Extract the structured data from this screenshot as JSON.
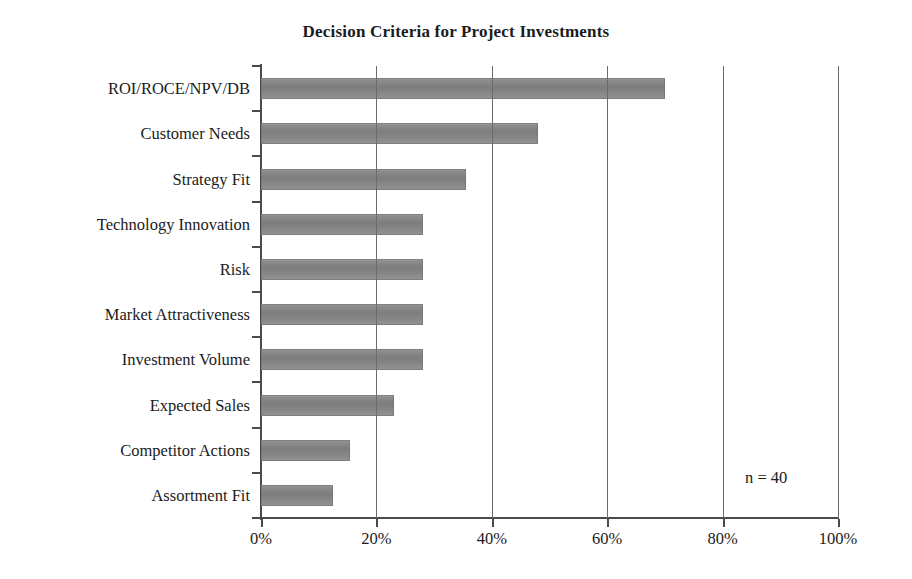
{
  "chart_data": {
    "type": "bar",
    "orientation": "horizontal",
    "title": "Decision Criteria for Project Investments",
    "xlabel": "",
    "ylabel": "",
    "categories": [
      "ROI/ROCE/NPV/DB",
      "Customer Needs",
      "Strategy Fit",
      "Technology Innovation",
      "Risk",
      "Market Attractiveness",
      "Investment Volume",
      "Expected Sales",
      "Competitor Actions",
      "Assortment Fit"
    ],
    "values": [
      70,
      48,
      35.5,
      28,
      28,
      28,
      28,
      23,
      15.5,
      12.5
    ],
    "xlim": [
      0,
      100
    ],
    "xticks": [
      0,
      20,
      40,
      60,
      80,
      100
    ],
    "xtick_labels": [
      "0%",
      "20%",
      "40%",
      "60%",
      "80%",
      "100%"
    ],
    "grid": "vertical",
    "legend": "none",
    "annotation": "n = 40",
    "bar_color": "#848484",
    "axis_color": "#4a4a4a",
    "text_color": "#1b1b1b",
    "background": "#ffffff"
  }
}
